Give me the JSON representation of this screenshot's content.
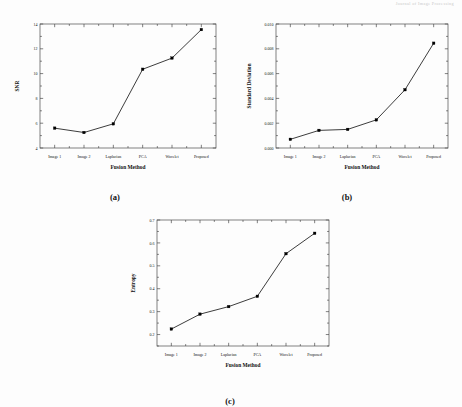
{
  "header": {
    "running_head": "Journal of Image Processing"
  },
  "figure": {
    "panels": [
      {
        "caption": "(a)",
        "name": "panel-a"
      },
      {
        "caption": "(b)",
        "name": "panel-b"
      },
      {
        "caption": "(c)",
        "name": "panel-c"
      }
    ]
  },
  "chart_data": [
    {
      "type": "line",
      "panel": "(a)",
      "title": "",
      "xlabel": "Fusion Method",
      "ylabel": "SNR",
      "categories": [
        "Image 1",
        "Image 2",
        "Laplacian",
        "PCA",
        "Wavelet",
        "Proposed"
      ],
      "values": [
        5.6,
        5.25,
        5.95,
        10.35,
        11.25,
        13.55
      ],
      "ylim": [
        4,
        14
      ],
      "yticks": [
        4,
        6,
        8,
        10,
        12,
        14
      ],
      "ytick_labels": [
        "4",
        "6",
        "8",
        "10",
        "12",
        "14"
      ],
      "grid": false,
      "legend": "none",
      "marker": "filled-square",
      "line_color": "#1a1a1a",
      "marker_color": "#000000"
    },
    {
      "type": "line",
      "panel": "(b)",
      "title": "",
      "xlabel": "Fusion Method",
      "ylabel": "Standard Deviation",
      "categories": [
        "Image 1",
        "Image 2",
        "Laplacian",
        "PCA",
        "Wavelet",
        "Proposed"
      ],
      "values": [
        0.0007,
        0.00142,
        0.0015,
        0.00227,
        0.0047,
        0.00845
      ],
      "ylim": [
        0.0,
        0.01
      ],
      "yticks": [
        0.0,
        0.002,
        0.004,
        0.006,
        0.008,
        0.01
      ],
      "ytick_labels": [
        "0.000",
        "0.002",
        "0.004",
        "0.006",
        "0.008",
        "0.010"
      ],
      "grid": false,
      "legend": "none",
      "marker": "filled-square",
      "line_color": "#1a1a1a",
      "marker_color": "#000000"
    },
    {
      "type": "line",
      "panel": "(c)",
      "title": "",
      "xlabel": "Fusion Method",
      "ylabel": "Entropy",
      "categories": [
        "Image 1",
        "Image 2",
        "Laplacian",
        "PCA",
        "Wavelet",
        "Proposed"
      ],
      "values": [
        0.224,
        0.289,
        0.322,
        0.367,
        0.553,
        0.642
      ],
      "ylim": [
        0.15,
        0.7
      ],
      "yticks": [
        0.2,
        0.3,
        0.4,
        0.5,
        0.6,
        0.7
      ],
      "ytick_labels": [
        "0.2",
        "0.3",
        "0.4",
        "0.5",
        "0.6",
        "0.7"
      ],
      "grid": false,
      "legend": "none",
      "marker": "filled-square",
      "line_color": "#1a1a1a",
      "marker_color": "#000000"
    }
  ]
}
